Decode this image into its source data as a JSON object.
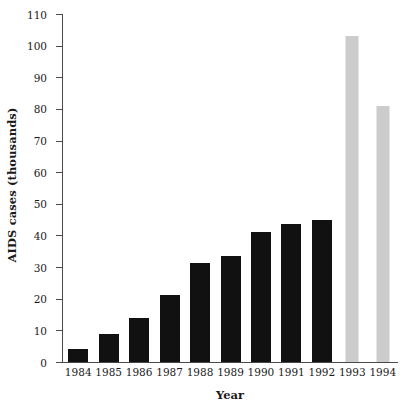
{
  "chart_data": {
    "type": "bar",
    "title": "",
    "xlabel": "Year",
    "ylabel": "AIDS cases (thousands)",
    "categories": [
      "1984",
      "1985",
      "1986",
      "1987",
      "1988",
      "1989",
      "1990",
      "1991",
      "1992",
      "1993",
      "1994"
    ],
    "values": [
      4,
      8.8,
      14,
      21.3,
      31.2,
      33.5,
      41.2,
      43.7,
      44.8,
      103,
      80.8
    ],
    "series": [
      {
        "name": "AIDS cases",
        "values": [
          4,
          8.8,
          14,
          21.3,
          31.2,
          33.5,
          41.2,
          43.7,
          44.8,
          103,
          80.8
        ],
        "bar_colors": [
          "#111111",
          "#111111",
          "#111111",
          "#111111",
          "#111111",
          "#111111",
          "#111111",
          "#111111",
          "#111111",
          "#cccccc",
          "#cccccc"
        ]
      }
    ],
    "ylim": [
      0,
      110
    ],
    "yticks": [
      0,
      10,
      20,
      30,
      40,
      50,
      60,
      70,
      80,
      90,
      100,
      110
    ],
    "ytick_labels": [
      "0",
      "10",
      "20",
      "30",
      "40",
      "50",
      "60",
      "70",
      "80",
      "90",
      "100",
      "110"
    ],
    "grid": false,
    "legend": "none",
    "colors": {
      "observed_bar": "#111111",
      "projected_bar": "#cccccc",
      "axis": "#4a4a4a",
      "background": "#ffffff",
      "text": "#1a1a1a"
    }
  }
}
